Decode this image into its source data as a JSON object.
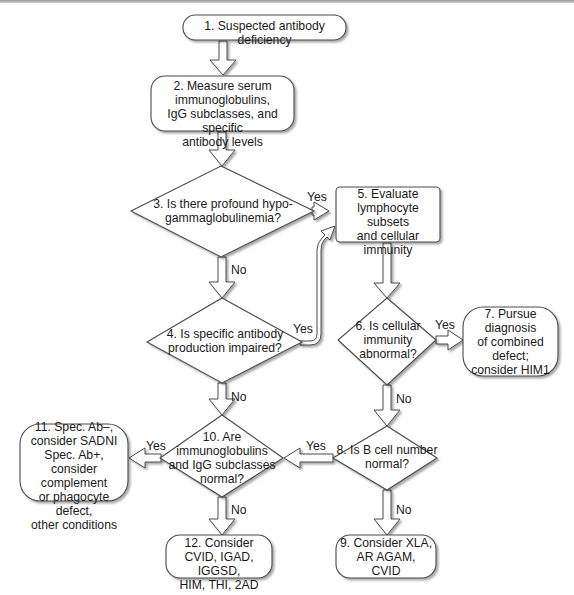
{
  "flowchart": {
    "nodes": {
      "n1": {
        "text": "1. Suspected antibody deficiency",
        "shape": "rounded"
      },
      "n2": {
        "text": "2. Measure serum\nimmunoglobulins,\nIgG subclasses, and specific\nantibody levels",
        "shape": "rounded"
      },
      "n3": {
        "text": "3. Is there profound hypo-\ngammaglobulinemia?",
        "shape": "diamond"
      },
      "n4": {
        "text": "4. Is specific antibody\nproduction impaired?",
        "shape": "diamond"
      },
      "n5": {
        "text": "5. Evaluate\nlymphocyte subsets\nand cellular\nimmunity",
        "shape": "rectangle"
      },
      "n6": {
        "text": "6. Is cellular\nimmunity\nabnormal?",
        "shape": "diamond"
      },
      "n7": {
        "text": "7. Pursue\ndiagnosis\nof combined\ndefect;\nconsider HIM1",
        "shape": "rounded"
      },
      "n8": {
        "text": "8. Is B cell number\nnormal?",
        "shape": "diamond"
      },
      "n9": {
        "text": "9. Consider XLA,\nAR AGAM,\nCVID",
        "shape": "rounded"
      },
      "n10": {
        "text": "10. Are\nimmunoglobulins\nand IgG subclasses\nnormal?",
        "shape": "diamond"
      },
      "n11": {
        "text": "11. Spec. Ab–,\nconsider SADNI\nSpec. Ab+,\nconsider complement\nor phagocyte defect,\nother conditions",
        "shape": "rounded"
      },
      "n12": {
        "text": "12. Consider\nCVID, IGAD, IGGSD,\nHIM, THI, 2AD",
        "shape": "rounded"
      }
    },
    "edges": [
      {
        "from": "n1",
        "to": "n2",
        "label": ""
      },
      {
        "from": "n2",
        "to": "n3",
        "label": ""
      },
      {
        "from": "n3",
        "to": "n5",
        "label": "Yes"
      },
      {
        "from": "n3",
        "to": "n4",
        "label": "No"
      },
      {
        "from": "n4",
        "to": "n5",
        "label": "Yes"
      },
      {
        "from": "n4",
        "to": "n10",
        "label": "No"
      },
      {
        "from": "n5",
        "to": "n6",
        "label": ""
      },
      {
        "from": "n6",
        "to": "n7",
        "label": "Yes"
      },
      {
        "from": "n6",
        "to": "n8",
        "label": "No"
      },
      {
        "from": "n8",
        "to": "n10",
        "label": "Yes"
      },
      {
        "from": "n8",
        "to": "n9",
        "label": "No"
      },
      {
        "from": "n10",
        "to": "n11",
        "label": "Yes"
      },
      {
        "from": "n10",
        "to": "n12",
        "label": "No"
      }
    ],
    "labels": {
      "yes": "Yes",
      "no": "No"
    },
    "colors": {
      "stroke": "#4a4a4a",
      "shadow": "#c8c8c8",
      "fill": "#ffffff",
      "text": "#1a1a1a"
    }
  }
}
